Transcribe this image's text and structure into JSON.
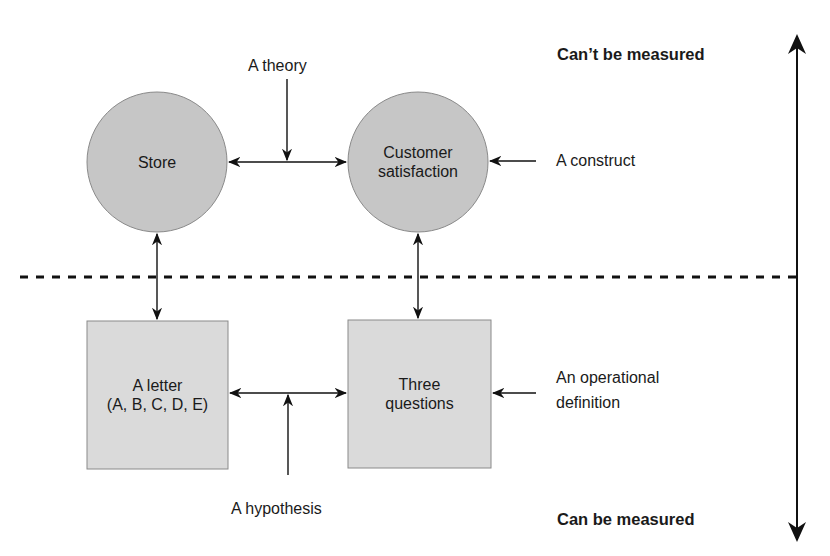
{
  "diagram": {
    "nodes": {
      "store": {
        "label": "Store",
        "shape": "circle"
      },
      "customer_satisfaction": {
        "label_line1": "Customer",
        "label_line2": "satisfaction",
        "shape": "circle"
      },
      "letter": {
        "label_line1": "A letter",
        "label_line2": "(A, B, C, D, E)",
        "shape": "square"
      },
      "three_questions": {
        "label_line1": "Three",
        "label_line2": "questions",
        "shape": "square"
      }
    },
    "annotations": {
      "theory": "A theory",
      "construct": "A construct",
      "hypothesis": "A hypothesis",
      "operational_line1": "An operational",
      "operational_line2": "definition"
    },
    "scale": {
      "top": "Can’t be measured",
      "bottom": "Can be measured"
    },
    "colors": {
      "node_fill": "#c8c8c8",
      "box_fill": "#dcdcdc",
      "stroke": "#111111",
      "node_border": "#8a8a8a"
    }
  }
}
